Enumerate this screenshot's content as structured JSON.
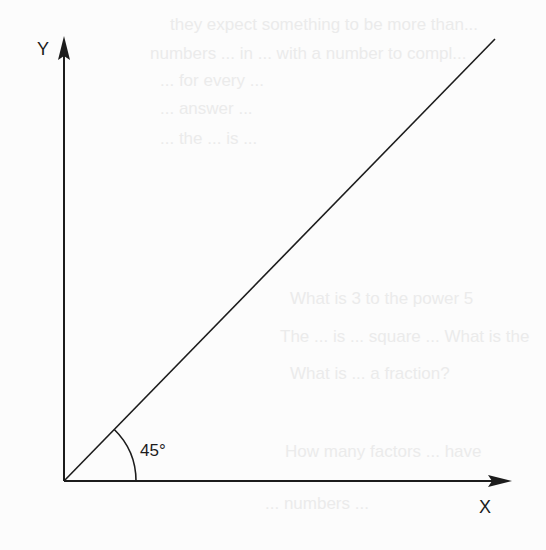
{
  "diagram": {
    "type": "angle-diagram",
    "axes": {
      "x_label": "X",
      "y_label": "Y"
    },
    "angle": {
      "label": "45°",
      "degrees": 45
    },
    "colors": {
      "ink": "#1c1c1c",
      "background": "#fcfcfc",
      "bleed_through": "#ebebeb"
    }
  },
  "bleed_through_text": [
    "they expect something to be more than...",
    "numbers ... in ... with a number to compl...",
    "... for every ... ",
    "... answer ...",
    "... the ... is ... ",
    "What is 3 to the power 5",
    "The ... is ... square ... What is the",
    "What is ... a fraction?",
    "How many factors ... have",
    "... numbers ..."
  ]
}
